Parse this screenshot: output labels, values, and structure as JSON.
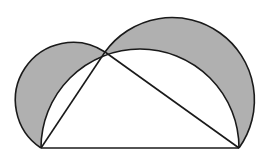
{
  "diagram": {
    "canvas": {
      "width": 268,
      "height": 160,
      "background": "#ffffff"
    },
    "colors": {
      "stroke": "#1a1a1a",
      "lune_fill": "#b0b0b0",
      "inner_fill": "#ffffff"
    },
    "stroke_width": 1.6,
    "points": {
      "A": [
        41,
        148
      ],
      "B": [
        239,
        148
      ],
      "C": [
        105,
        52
      ]
    },
    "shapes": [
      {
        "id": "lune-left",
        "type": "lune",
        "chord": [
          "A",
          "C"
        ],
        "description": "shaded crescent on side AC"
      },
      {
        "id": "lune-right",
        "type": "lune",
        "chord": [
          "C",
          "B"
        ],
        "description": "shaded crescent on side CB"
      },
      {
        "id": "big-semicircle",
        "type": "semicircle",
        "diameter": [
          "A",
          "B"
        ]
      },
      {
        "id": "triangle",
        "type": "polygon",
        "vertices": [
          "A",
          "B",
          "C"
        ]
      }
    ]
  }
}
